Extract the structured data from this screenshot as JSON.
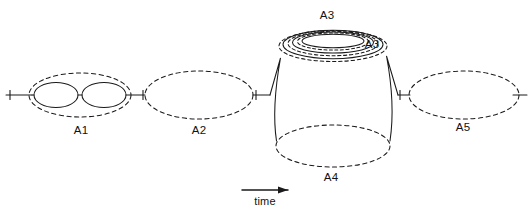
{
  "figure": {
    "title": "",
    "background_color": "#ffffff",
    "stroke_color": "#1a1a1a",
    "axis": {
      "label": "time",
      "direction": "left-to-right",
      "arrow_name": "time-arrow"
    },
    "labels": {
      "a1": "A1",
      "a2": "A2",
      "a3_outer": "A3",
      "a3_inner": "A3",
      "a4": "A4",
      "a5": "A5",
      "time": "time"
    },
    "components": [
      {
        "id": "A1",
        "label": "A1",
        "style": "dashed-ellipse",
        "contains": [
          "solid-ellipse",
          "solid-ellipse"
        ],
        "connector": "solid-line"
      },
      {
        "id": "A2",
        "label": "A2",
        "style": "dashed-ellipse",
        "contains": []
      },
      {
        "id": "A3",
        "label": "A3",
        "style": "nested-rings",
        "ring_count": 5,
        "location": "barrel-top"
      },
      {
        "id": "A4",
        "label": "A4",
        "style": "dashed-ellipse",
        "location": "barrel-bottom"
      },
      {
        "id": "A5",
        "label": "A5",
        "style": "dashed-ellipse",
        "contains": []
      }
    ]
  }
}
